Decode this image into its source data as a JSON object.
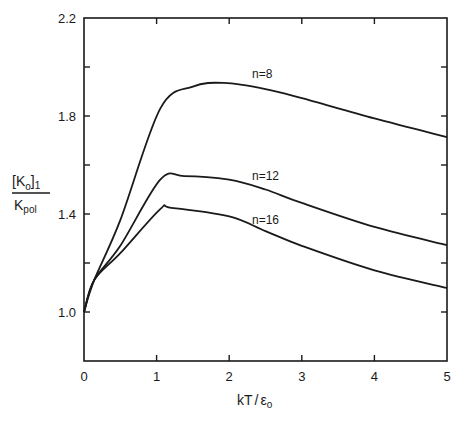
{
  "chart_data": {
    "type": "line",
    "title": "",
    "xlabel": "kT/ε0",
    "ylabel": "[K0]1 / Kpol",
    "xlim": [
      0,
      5
    ],
    "ylim": [
      0.8,
      2.2
    ],
    "grid": false,
    "legend_position": "inline labels",
    "x_ticks": [
      "0",
      "1",
      "2",
      "3",
      "4",
      "5"
    ],
    "y_ticks": [
      "1.0",
      "1.4",
      "1.8",
      "2.2"
    ],
    "y_minor_ticks": [
      1.2,
      1.6,
      2.0
    ],
    "series": [
      {
        "name": "n=8",
        "x": [
          0,
          0.14,
          0.5,
          1.05,
          1.5,
          1.93,
          2.5,
          3.0,
          4.0,
          5.0
        ],
        "values": [
          1.0,
          1.13,
          1.375,
          1.83,
          1.92,
          1.935,
          1.91,
          1.873,
          1.79,
          1.714
        ]
      },
      {
        "name": "n=12",
        "x": [
          0,
          0.14,
          0.5,
          1.05,
          1.38,
          2.0,
          2.5,
          3.0,
          4.0,
          5.0
        ],
        "values": [
          1.0,
          1.13,
          1.27,
          1.54,
          1.555,
          1.54,
          1.5,
          1.445,
          1.347,
          1.273
        ]
      },
      {
        "name": "n=16",
        "x": [
          0,
          0.14,
          0.5,
          1.05,
          1.2,
          2.0,
          2.5,
          3.0,
          4.0,
          5.0
        ],
        "values": [
          1.0,
          1.13,
          1.24,
          1.42,
          1.425,
          1.39,
          1.33,
          1.27,
          1.17,
          1.098
        ]
      }
    ],
    "annotations": [
      "n=8",
      "n=12",
      "n=16"
    ]
  },
  "axes": {
    "x_title_main": "kT",
    "x_title_sep": "/",
    "x_title_eps": "ε",
    "x_title_sub": "o",
    "y_title_num": "[K",
    "y_title_num_sub": "o",
    "y_title_num_close": "]",
    "y_title_num_sub2": "1",
    "y_title_den": "K",
    "y_title_den_sub": "pol"
  }
}
